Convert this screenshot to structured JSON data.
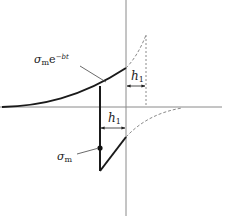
{
  "diagram": {
    "title": "",
    "labels": {
      "decay_sigma": "σ",
      "decay_sub": "m",
      "decay_e": "e",
      "decay_exp": "−bt",
      "h_upper_main": "h",
      "h_upper_sub": "1",
      "h_lower_main": "h",
      "h_lower_sub": "1",
      "sigma_m_main": "σ",
      "sigma_m_sub": "m"
    },
    "colors": {
      "axis": "#8a8a8a",
      "curve": "#1a1a1a",
      "dashed": "#8a8a8a",
      "text": "#222222"
    },
    "axes": {
      "origin": [
        126,
        107
      ],
      "x_range": [
        0,
        222
      ],
      "y_range": [
        0,
        216
      ]
    },
    "elements": [
      {
        "type": "solid-curve",
        "name": "exponential-envelope",
        "from": [
          2,
          107
        ],
        "to": [
          126,
          68
        ]
      },
      {
        "type": "dashed-curve",
        "name": "envelope-continuation",
        "from": [
          126,
          68
        ],
        "to": [
          146,
          35
        ]
      },
      {
        "type": "dotted-line",
        "name": "upper-marker",
        "from": [
          146,
          35
        ],
        "to": [
          146,
          107
        ]
      },
      {
        "type": "dimension",
        "name": "h1-upper",
        "from": [
          126,
          86
        ],
        "to": [
          146,
          86
        ]
      },
      {
        "type": "solid-line",
        "name": "vertical-drop",
        "from": [
          100,
          87
        ],
        "to": [
          100,
          171
        ]
      },
      {
        "type": "dimension",
        "name": "h1-lower",
        "from": [
          100,
          128
        ],
        "to": [
          126,
          128
        ]
      },
      {
        "type": "solid-line",
        "name": "diagonal-return",
        "from": [
          100,
          171
        ],
        "to": [
          126,
          137
        ]
      },
      {
        "type": "dashed-curve",
        "name": "lower-continuation",
        "from": [
          126,
          137
        ],
        "to": [
          180,
          108
        ]
      },
      {
        "type": "point",
        "name": "sigma-m-point",
        "at": [
          100,
          148
        ]
      }
    ]
  }
}
